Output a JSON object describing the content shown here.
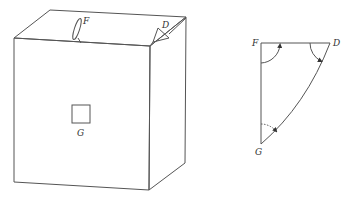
{
  "figure": {
    "cube": {
      "labels": {
        "F": "F",
        "D": "D",
        "G": "G"
      }
    },
    "triangle": {
      "labels": {
        "F": "F",
        "D": "D",
        "G": "G"
      }
    },
    "colors": {
      "line": "#555555",
      "background": "#ffffff"
    }
  }
}
